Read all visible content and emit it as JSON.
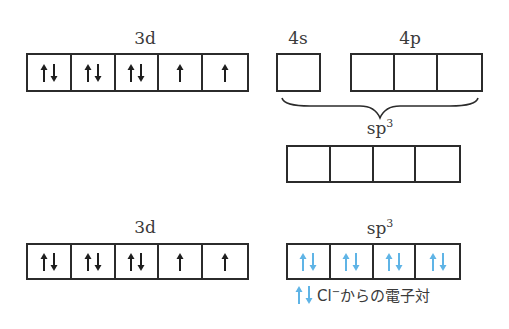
{
  "colors": {
    "line": "#2b2b2b",
    "electron": "#1e1e1e",
    "donated_electron": "#5fb4e6"
  },
  "top": {
    "d_label": "3d",
    "d_orbitals": [
      "updown",
      "updown",
      "updown",
      "up",
      "up"
    ],
    "s_label": "4s",
    "s_orbitals": [
      "empty"
    ],
    "p_label": "4p",
    "p_orbitals": [
      "empty",
      "empty",
      "empty"
    ],
    "hybrid_label": "sp",
    "hybrid_sup": "3",
    "hybrid_orbitals": [
      "empty",
      "empty",
      "empty",
      "empty"
    ]
  },
  "bottom": {
    "d_label": "3d",
    "d_orbitals": [
      "updown",
      "updown",
      "updown",
      "up",
      "up"
    ],
    "hybrid_label": "sp",
    "hybrid_sup": "3",
    "hybrid_orbitals": [
      "updown-blue",
      "updown-blue",
      "updown-blue",
      "updown-blue"
    ]
  },
  "legend": {
    "text_pre": "Cl",
    "text_sup": "−",
    "text_post": "からの電子対"
  }
}
